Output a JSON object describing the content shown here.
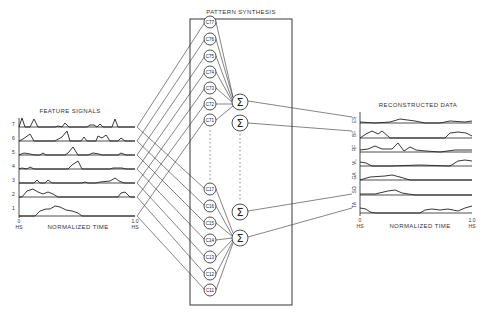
{
  "left_panel": {
    "title": "FEATURE SIGNALS",
    "xlabel": "NORMALIZED TIME",
    "x_start": "0",
    "x_end": "1.0",
    "x_start_unit": "HS",
    "x_end_unit": "HS",
    "rows": [
      "7",
      "6",
      "5",
      "4",
      "3",
      "2",
      "1"
    ]
  },
  "center_panel": {
    "title": "PATTERN SYNTHESIS",
    "upper_nodes": [
      "C77",
      "C76",
      "C75",
      "C74",
      "C73",
      "C72",
      "C71"
    ],
    "lower_nodes": [
      "C17",
      "C16",
      "C15",
      "C14",
      "C13",
      "C12",
      "C11"
    ],
    "sum_symbol": "Σ",
    "sum_nodes": 4
  },
  "right_panel": {
    "title": "RECONSTRUCTED DATA",
    "xlabel": "NORMALIZED TIME",
    "x_start": "0",
    "x_end": "1.0",
    "x_start_unit": "HS",
    "x_end_unit": "HS",
    "rows": [
      "ES",
      "BF",
      "RF",
      "VL",
      "GA",
      "SO",
      "TA"
    ]
  }
}
